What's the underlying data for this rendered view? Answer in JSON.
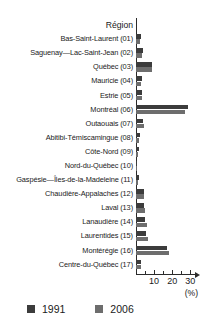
{
  "caption_remnant": "",
  "legend": {
    "items": [
      {
        "label": "1991",
        "color": "#3c3c3c"
      },
      {
        "label": "2006",
        "color": "#6d6d6d"
      }
    ]
  },
  "axis": {
    "unit": "(%)",
    "header": "Région",
    "tick_labels": [
      "10",
      "20",
      "30"
    ]
  },
  "chart_data": {
    "type": "bar",
    "orientation": "horizontal",
    "title": "",
    "xlabel": "(%)",
    "ylabel": "Région",
    "xlim": [
      0,
      32
    ],
    "xticks": [
      10,
      20,
      30
    ],
    "xminorticks": [
      5,
      15,
      25
    ],
    "grid": false,
    "legend_position": "bottom-left",
    "categories": [
      "Bas-Saint-Laurent (01)",
      "Saguenay—Lac-Saint-Jean (02)",
      "Québec (03)",
      "Mauricie (04)",
      "Estrie (05)",
      "Montréal (06)",
      "Outaouais (07)",
      "Abitibi-Témiscamingue (08)",
      "Côte-Nord (09)",
      "Nord-du-Québec (10)",
      "Gaspésie—Îles-de-la-Madeleine (11)",
      "Chaudière-Appalaches (12)",
      "Laval (13)",
      "Lanaudière (14)",
      "Laurentides (15)",
      "Montérégie (16)",
      "Centre-du-Québec (17)"
    ],
    "series": [
      {
        "name": "1991",
        "color": "#3c3c3c",
        "values": [
          2.7,
          3.6,
          8.6,
          3.1,
          3.4,
          28.6,
          4.0,
          2.2,
          1.5,
          0.5,
          1.4,
          4.3,
          4.4,
          5.1,
          5.6,
          17.2,
          2.6
        ]
      },
      {
        "name": "2006",
        "color": "#6d6d6d",
        "values": [
          2.3,
          3.1,
          9.0,
          2.7,
          3.3,
          26.9,
          4.6,
          1.9,
          1.2,
          0.5,
          1.2,
          4.6,
          5.2,
          6.0,
          6.6,
          18.0,
          2.8
        ]
      }
    ]
  }
}
